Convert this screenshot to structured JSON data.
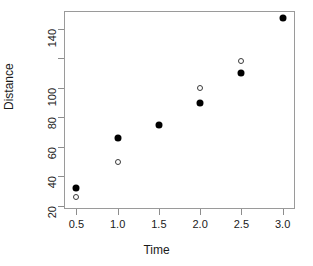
{
  "chart_data": {
    "type": "scatter",
    "title": "",
    "xlabel": "Time",
    "ylabel": "Distance",
    "xlim": [
      0.35,
      3.15
    ],
    "ylim": [
      18,
      152
    ],
    "grid": false,
    "legend": null,
    "xticks": [
      0.5,
      1.0,
      1.5,
      2.0,
      2.5,
      3.0
    ],
    "xticklabels": [
      "0.5",
      "1.0",
      "1.5",
      "2.0",
      "2.5",
      "3.0"
    ],
    "yticks": [
      20,
      40,
      60,
      80,
      100,
      120,
      140
    ],
    "yticklabels": [
      "20",
      "40",
      "60",
      "80",
      "100",
      "",
      "140"
    ],
    "series": [
      {
        "name": "filled",
        "marker": "filled-circle",
        "color": "#000000",
        "points": [
          {
            "x": 0.5,
            "y": 32
          },
          {
            "x": 1.0,
            "y": 66
          },
          {
            "x": 1.5,
            "y": 75
          },
          {
            "x": 2.0,
            "y": 90
          },
          {
            "x": 2.5,
            "y": 110
          },
          {
            "x": 3.0,
            "y": 147
          }
        ]
      },
      {
        "name": "open",
        "marker": "open-circle",
        "color": "#3a3a3a",
        "points": [
          {
            "x": 0.5,
            "y": 26
          },
          {
            "x": 1.0,
            "y": 50
          },
          {
            "x": 2.0,
            "y": 100
          },
          {
            "x": 2.5,
            "y": 118
          }
        ]
      }
    ]
  }
}
